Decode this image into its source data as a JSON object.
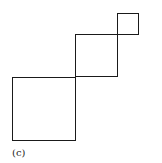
{
  "figure": {
    "label": "(c)",
    "stroke_color": "#1a1a1a",
    "squares": [
      {
        "name": "small",
        "x": 117,
        "y": 13,
        "size": 21
      },
      {
        "name": "medium",
        "x": 75,
        "y": 35,
        "size": 42
      },
      {
        "name": "large",
        "x": 12,
        "y": 77,
        "size": 63
      }
    ]
  }
}
